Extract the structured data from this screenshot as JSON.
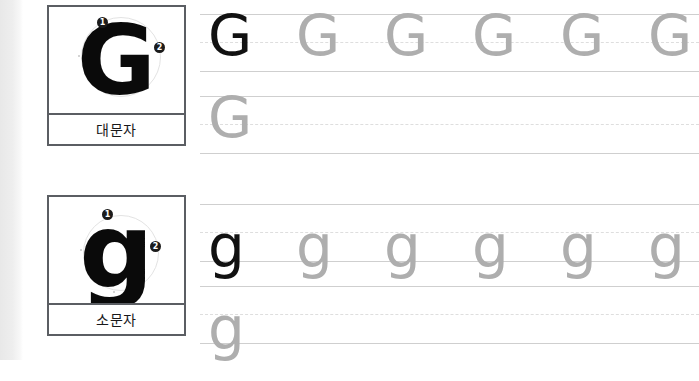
{
  "worksheet": {
    "title": "Letter G handwriting practice worksheet",
    "language": "ko"
  },
  "sections": [
    {
      "id": "uppercase",
      "letter": "G",
      "label": "대문자",
      "model": {
        "glyph": "G",
        "stroke_markers": [
          {
            "number": "1",
            "glyph": "❶"
          },
          {
            "number": "2",
            "glyph": "❷"
          }
        ]
      },
      "rows": [
        {
          "id": "upper-row-1",
          "glyphs": [
            {
              "char": "G",
              "shade": "dark"
            },
            {
              "char": "G",
              "shade": "faint"
            },
            {
              "char": "G",
              "shade": "faint"
            },
            {
              "char": "G",
              "shade": "faint"
            },
            {
              "char": "G",
              "shade": "faint"
            },
            {
              "char": "G",
              "shade": "faint"
            }
          ]
        },
        {
          "id": "upper-row-2",
          "glyphs": [
            {
              "char": "G",
              "shade": "faint"
            }
          ]
        }
      ]
    },
    {
      "id": "lowercase",
      "letter": "g",
      "label": "소문자",
      "model": {
        "glyph": "g",
        "stroke_markers": [
          {
            "number": "1",
            "glyph": "❶"
          },
          {
            "number": "2",
            "glyph": "❷"
          }
        ]
      },
      "rows": [
        {
          "id": "lower-row-1",
          "glyphs": [
            {
              "char": "g",
              "shade": "dark"
            },
            {
              "char": "g",
              "shade": "faint"
            },
            {
              "char": "g",
              "shade": "faint"
            },
            {
              "char": "g",
              "shade": "faint"
            },
            {
              "char": "g",
              "shade": "faint"
            },
            {
              "char": "g",
              "shade": "faint"
            }
          ]
        },
        {
          "id": "lower-row-2",
          "glyphs": [
            {
              "char": "g",
              "shade": "faint"
            }
          ]
        }
      ]
    }
  ],
  "colors": {
    "ink_dark": "#111111",
    "ink_faint": "#aeaeae",
    "rule_solid": "#cfcfcf",
    "rule_dashed": "#dedede",
    "card_border": "#5b5e63",
    "label_text": "#18181a",
    "page_background": "#ffffff"
  },
  "layout": {
    "glyph_x_positions": [
      8,
      96,
      184,
      272,
      360,
      448
    ]
  }
}
